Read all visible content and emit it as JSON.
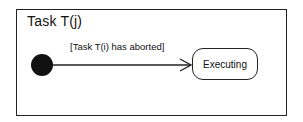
{
  "frame": {
    "title": "Task T(j)"
  },
  "initial_node": {
    "shape": "filled-circle",
    "color": "#111111"
  },
  "transition": {
    "guard": "[Task T(i) has aborted]",
    "from": "initial",
    "to": "Executing",
    "arrowhead": "open"
  },
  "states": [
    {
      "name": "Executing"
    }
  ],
  "colors": {
    "line": "#222222",
    "text": "#111111",
    "background": "#ffffff"
  }
}
